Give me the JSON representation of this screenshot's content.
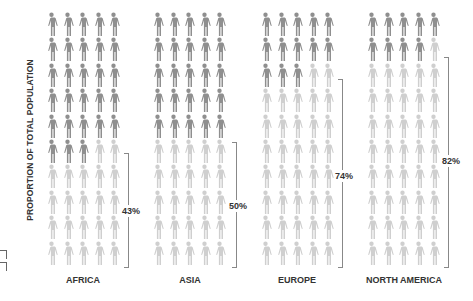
{
  "chart_data": {
    "type": "pictogram",
    "title": "",
    "ylabel": "PROPORTION OF TOTAL POPULATION",
    "xlabel": "",
    "icons_per_group": 50,
    "grid": {
      "rows": 10,
      "cols": 5
    },
    "categories": [
      "AFRICA",
      "ASIA",
      "EUROPE",
      "NORTH AMERICA"
    ],
    "values": [
      43,
      50,
      74,
      82
    ],
    "value_labels": [
      "43%",
      "50%",
      "74%",
      "82%"
    ],
    "colors": {
      "highlighted": "#cfcfcf",
      "rest": "#8f8f8f"
    },
    "legend": "none"
  },
  "axis": {
    "ylabel": "PROPORTION OF TOTAL POPULATION"
  },
  "groups": [
    {
      "label": "AFRICA",
      "pct_label": "43%",
      "value": 43
    },
    {
      "label": "ASIA",
      "pct_label": "50%",
      "value": 50
    },
    {
      "label": "EUROPE",
      "pct_label": "74%",
      "value": 74
    },
    {
      "label": "NORTH AMERICA",
      "pct_label": "82%",
      "value": 82
    }
  ]
}
